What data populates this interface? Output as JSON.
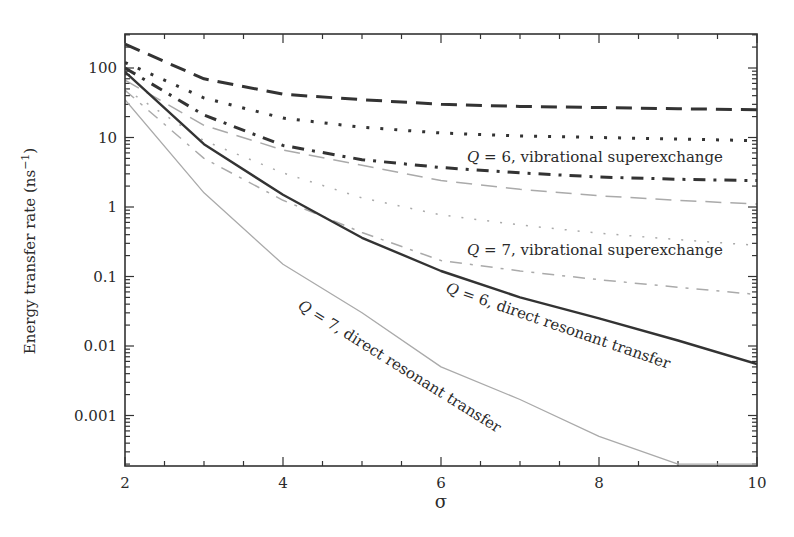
{
  "chart_data": {
    "type": "line",
    "title": "",
    "xlabel": "σ",
    "ylabel": "Energy transfer rate (ns",
    "ylabel_sup": "−1",
    "ylabel_close": ")",
    "yscale": "log",
    "xlim": [
      2,
      10
    ],
    "ylim": [
      0.0002,
      300
    ],
    "x_ticks": [
      2,
      4,
      6,
      8,
      10
    ],
    "x_tick_labels": [
      "2",
      "4",
      "6",
      "8",
      "10"
    ],
    "y_ticks": [
      100,
      10,
      1,
      0.1,
      0.01,
      0.001
    ],
    "y_tick_labels": [
      "100",
      "10",
      "1",
      "0.1",
      "0.01",
      "0.001"
    ],
    "grid": false,
    "legend": "none (inline annotations)",
    "x": [
      2,
      3,
      4,
      5,
      6,
      7,
      8,
      9,
      10
    ],
    "series": [
      {
        "name": "Q = 6, long dash (dark)",
        "color": "#333333",
        "width": 3,
        "dash": "16 9",
        "values": [
          220,
          70,
          42,
          35,
          30,
          28,
          27,
          26,
          25
        ]
      },
      {
        "name": "Q = 6, dotted (dark)",
        "color": "#333333",
        "width": 3,
        "dash": "3 11",
        "values": [
          120,
          37,
          19,
          14,
          11.6,
          10.5,
          10,
          9.5,
          9
        ]
      },
      {
        "name": "Q = 6, vibrational superexchange (dash-dot, dark)",
        "color": "#333333",
        "width": 3,
        "dash": "12 8 3 8",
        "values": [
          100,
          21,
          7.7,
          4.8,
          3.7,
          3.1,
          2.7,
          2.5,
          2.4
        ]
      },
      {
        "name": "Q = 7, long dash (light)",
        "color": "#aaaaaa",
        "width": 1.5,
        "dash": "16 9",
        "values": [
          67,
          15,
          6.6,
          4.0,
          2.4,
          1.8,
          1.45,
          1.25,
          1.1
        ]
      },
      {
        "name": "Q = 7, dotted (light)",
        "color": "#aaaaaa",
        "width": 1.5,
        "dash": "2 11",
        "values": [
          50,
          9,
          3.1,
          1.35,
          0.77,
          0.55,
          0.42,
          0.34,
          0.28
        ]
      },
      {
        "name": "Q = 7, vibrational superexchange (dash-dot, light)",
        "color": "#aaaaaa",
        "width": 1.5,
        "dash": "12 8 3 8",
        "values": [
          48,
          5,
          1.25,
          0.43,
          0.17,
          0.12,
          0.09,
          0.07,
          0.055
        ]
      },
      {
        "name": "Q = 6, direct resonant transfer",
        "color": "#333333",
        "width": 2.4,
        "dash": "",
        "values": [
          88,
          8,
          1.5,
          0.36,
          0.12,
          0.05,
          0.025,
          0.012,
          0.0055
        ]
      },
      {
        "name": "Q = 7, direct resonant transfer",
        "color": "#aaaaaa",
        "width": 1.3,
        "dash": "",
        "values": [
          35,
          1.6,
          0.15,
          0.03,
          0.005,
          0.0017,
          0.0005,
          0.0002,
          0.0002
        ]
      }
    ],
    "annotations": [
      {
        "text_q": "Q",
        "text_rest": " = 6, vibrational superexchange",
        "x": 467,
        "y": 162,
        "rotate": 0
      },
      {
        "text_q": "Q",
        "text_rest": " = 7, vibrational superexchange",
        "x": 467,
        "y": 255,
        "rotate": 0
      },
      {
        "text_q": "Q",
        "text_rest": " = 6, direct resonant transfer",
        "x": 445,
        "y": 292,
        "rotate": 19
      },
      {
        "text_q": "Q",
        "text_rest": " = 7, direct resonant transfer",
        "x": 297,
        "y": 308,
        "rotate": 32
      }
    ]
  }
}
